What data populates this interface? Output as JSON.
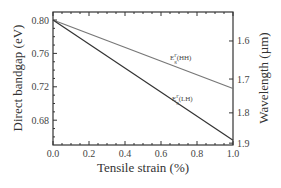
{
  "chart_data": {
    "type": "line",
    "title": "",
    "xlabel": "Tensile strain (%)",
    "ylabel": "Direct bandgap (eV)",
    "y2label": "Wavelength (µm)",
    "xlim": [
      0.0,
      1.0
    ],
    "ylim": [
      0.65,
      0.81
    ],
    "x_ticks": [
      "0.0",
      "0.2",
      "0.4",
      "0.6",
      "0.8",
      "1.0"
    ],
    "y_ticks": [
      "0.80",
      "0.76",
      "0.72",
      "0.68"
    ],
    "y2_ticks": [
      "1.6",
      "1.7",
      "1.8",
      "1.9"
    ],
    "grid": false,
    "legend": "inline labels",
    "series": [
      {
        "name": "E_g^Γ(HH)",
        "label_main": "E",
        "label_sub": "g",
        "label_sup": "Γ",
        "label_rest": "(HH)",
        "x": [
          0.0,
          1.0
        ],
        "values": [
          0.8,
          0.718
        ],
        "color": "#777777"
      },
      {
        "name": "E_g^Γ(LH)",
        "label_main": "E",
        "label_sub": "g",
        "label_sup": "Γ",
        "label_rest": "(LH)",
        "x": [
          0.0,
          1.0
        ],
        "values": [
          0.8,
          0.656
        ],
        "color": "#333333"
      }
    ]
  }
}
